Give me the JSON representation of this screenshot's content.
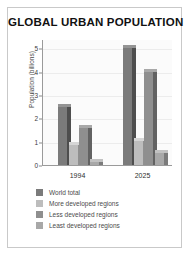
{
  "chart_data": {
    "type": "bar",
    "title": "GLOBAL URBAN POPULATION",
    "xlabel": "",
    "ylabel": "Population (billions)",
    "categories": [
      "1994",
      "2025"
    ],
    "yticks": [
      0,
      1,
      2,
      3,
      4,
      5
    ],
    "ylim": [
      0,
      5.4
    ],
    "grid": true,
    "legend_position": "bottom-left",
    "series": [
      {
        "name": "World total",
        "values": [
          2.5,
          5.0
        ],
        "color": "#7b7b7b"
      },
      {
        "name": "More developed regions",
        "values": [
          0.85,
          1.05
        ],
        "color": "#bdbdbd"
      },
      {
        "name": "Less developed regions",
        "values": [
          1.6,
          4.0
        ],
        "color": "#8f8f8f"
      },
      {
        "name": "Least developed regions",
        "values": [
          0.15,
          0.5
        ],
        "color": "#a8a8a8"
      }
    ]
  },
  "colors": {
    "frame": "#c9c9c9",
    "plot_background": "#fbfbfb",
    "axis": "#9a9a9a",
    "gridline": "#ececec",
    "bar_side_shadow": "#4c4c4c",
    "title_text": "#111111",
    "tick_text": "#3d3d3d"
  }
}
